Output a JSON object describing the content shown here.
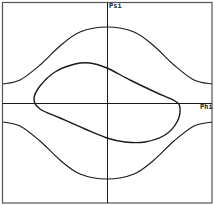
{
  "chart_data": {
    "type": "line",
    "title": "",
    "xlabel": "Phi",
    "ylabel": "Psi",
    "grid": false,
    "legend": null,
    "axes": {
      "origin_centered": true,
      "frame": true
    },
    "series": [
      {
        "name": "upper-separatrix",
        "description": "open curve above axis, max at Phi=0",
        "points_px": [
          [
            3,
            84
          ],
          [
            20,
            80
          ],
          [
            40,
            65
          ],
          [
            60,
            46
          ],
          [
            80,
            32
          ],
          [
            107,
            27
          ],
          [
            134,
            32
          ],
          [
            154,
            46
          ],
          [
            174,
            65
          ],
          [
            194,
            80
          ],
          [
            212,
            84
          ]
        ]
      },
      {
        "name": "lower-separatrix",
        "description": "open curve below axis, min at Phi=0",
        "points_px": [
          [
            3,
            122
          ],
          [
            20,
            126
          ],
          [
            40,
            141
          ],
          [
            60,
            160
          ],
          [
            80,
            174
          ],
          [
            107,
            179
          ],
          [
            134,
            174
          ],
          [
            154,
            160
          ],
          [
            174,
            141
          ],
          [
            194,
            126
          ],
          [
            212,
            122
          ]
        ]
      },
      {
        "name": "closed-orbit",
        "description": "closed loop around origin, tilted",
        "closed": true,
        "points_px": [
          [
            34,
            99
          ],
          [
            40,
            86
          ],
          [
            55,
            72
          ],
          [
            75,
            64
          ],
          [
            90,
            63
          ],
          [
            107,
            68
          ],
          [
            130,
            80
          ],
          [
            155,
            92
          ],
          [
            175,
            101
          ],
          [
            180,
            108
          ],
          [
            177,
            122
          ],
          [
            165,
            135
          ],
          [
            145,
            142
          ],
          [
            125,
            142
          ],
          [
            107,
            138
          ],
          [
            85,
            129
          ],
          [
            60,
            118
          ],
          [
            40,
            109
          ]
        ]
      }
    ],
    "colors": {
      "curve": "#1a1a1a",
      "axis": "#1a1a1a",
      "frame": "#555555",
      "background": "#ffffff"
    }
  }
}
